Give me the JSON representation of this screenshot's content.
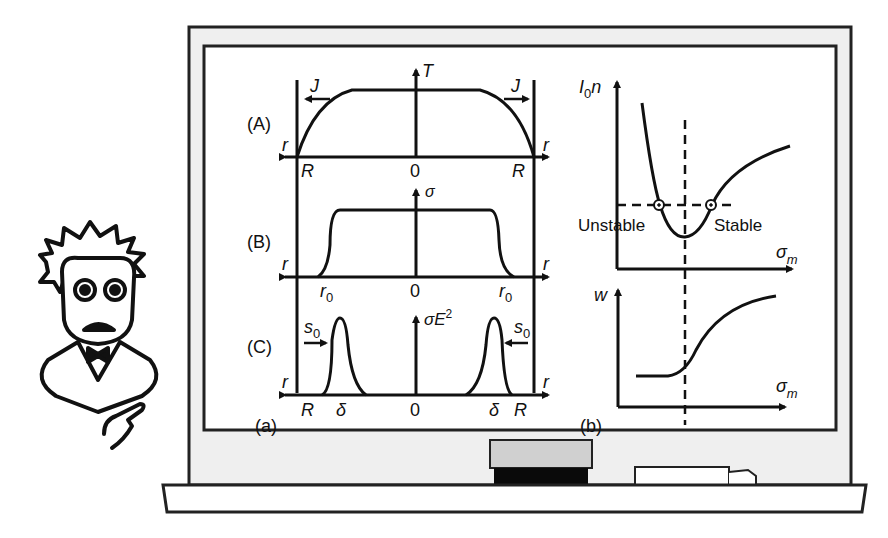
{
  "panel_a": {
    "label": "(a)",
    "row_A": {
      "label": "(A)",
      "y_axis": "T",
      "flux": "J",
      "left_edge": "R",
      "right_edge": "R",
      "center": "0",
      "axis_left": "r",
      "axis_right": "r"
    },
    "row_B": {
      "label": "(B)",
      "y_axis": "σ",
      "left_mark": "r",
      "left_mark_sub": "0",
      "right_mark": "r",
      "right_mark_sub": "0",
      "center": "0",
      "axis_left": "r",
      "axis_right": "r"
    },
    "row_C": {
      "label": "(C)",
      "y_axis": "σE",
      "y_axis_sup": "2",
      "shift": "s",
      "shift_sub": "0",
      "left_edge": "R",
      "right_edge": "R",
      "delta": "δ",
      "center": "0",
      "axis_left": "r",
      "axis_right": "r"
    }
  },
  "panel_b": {
    "label": "(b)",
    "top": {
      "y_axis": "I",
      "y_axis_sub": "0",
      "y_axis_tail": "n",
      "x_axis": "σ",
      "x_axis_sub": "m",
      "unstable": "Unstable",
      "stable": "Stable"
    },
    "bottom": {
      "y_axis": "w",
      "x_axis": "σ",
      "x_axis_sub": "m"
    }
  },
  "colors": {
    "ink": "#111111",
    "frame": "#efefef",
    "eraser_top": "#d0d0d0",
    "eraser_base": "#0a0a0a"
  }
}
